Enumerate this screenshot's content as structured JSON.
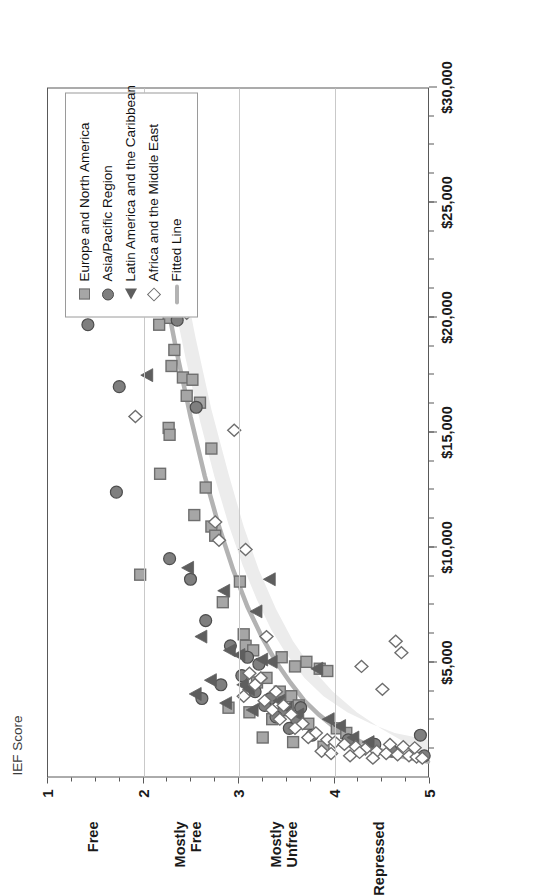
{
  "chart_data": {
    "type": "scatter",
    "title": "",
    "xlabel": "IEF Score",
    "ylabel": "",
    "xlim": [
      1,
      5
    ],
    "ylim": [
      0,
      30000
    ],
    "grid": true,
    "orientation": "rotated-90",
    "legend_position": "inside-upper-right",
    "axis": {
      "score_title": "IEF Score",
      "score_ticks": [
        "1",
        "2",
        "3",
        "4",
        "5"
      ],
      "score_tick_values": [
        1,
        2,
        3,
        4,
        5
      ],
      "money_ticks": [
        "$5,000",
        "$10,000",
        "$15,000",
        "$20,000",
        "$25,000",
        "$30,000"
      ],
      "money_tick_values": [
        5000,
        10000,
        15000,
        20000,
        25000,
        30000
      ],
      "money_minor_step": 1250,
      "categories": [
        {
          "label": "Free",
          "at": 1.5
        },
        {
          "label": "Mostly\nFree",
          "at": 2.5
        },
        {
          "label": "Mostly\nUnfree",
          "at": 3.5
        },
        {
          "label": "Repressed",
          "at": 4.5
        }
      ]
    },
    "colors": {
      "square": "#a6a6a6",
      "square_edge": "#6e6e6e",
      "circle": "#7f7f7f",
      "circle_edge": "#4d4d4d",
      "triangle": "#5e5e5e",
      "diamond": "#ffffff",
      "diamond_edge": "#6e6e6e",
      "fitted_line": "#b3b3b3",
      "band": "#ececec",
      "grid": "#c9c9c9",
      "frame": "#595959"
    },
    "legend": [
      {
        "label": "Europe and North America",
        "marker": "square-marker"
      },
      {
        "label": "Asia/Pacific Region",
        "marker": "circle-marker"
      },
      {
        "label": "Latin America and the Caribbean",
        "marker": "triangle-marker"
      },
      {
        "label": "Africa and the Middle East",
        "marker": "diamond-marker"
      },
      {
        "label": "Fitted Line",
        "marker": "line-swatch"
      }
    ],
    "series": [
      {
        "name": "Europe and North America",
        "marker": "square",
        "points": [
          [
            2.1,
            24700
          ],
          [
            1.95,
            23400
          ],
          [
            1.98,
            21000
          ],
          [
            2.27,
            20000
          ],
          [
            2.17,
            19700
          ],
          [
            2.33,
            18600
          ],
          [
            2.3,
            17900
          ],
          [
            2.42,
            17400
          ],
          [
            2.52,
            17300
          ],
          [
            2.46,
            16600
          ],
          [
            2.6,
            16300
          ],
          [
            2.27,
            15200
          ],
          [
            2.28,
            14900
          ],
          [
            2.72,
            14300
          ],
          [
            2.18,
            13200
          ],
          [
            2.66,
            12600
          ],
          [
            2.54,
            11400
          ],
          [
            2.72,
            10900
          ],
          [
            2.76,
            10500
          ],
          [
            1.97,
            8800
          ],
          [
            3.02,
            8500
          ],
          [
            2.84,
            7600
          ],
          [
            3.06,
            6200
          ],
          [
            3.08,
            5700
          ],
          [
            3.16,
            5500
          ],
          [
            3.46,
            5200
          ],
          [
            3.72,
            5000
          ],
          [
            3.6,
            4800
          ],
          [
            3.86,
            4700
          ],
          [
            3.94,
            4600
          ],
          [
            3.3,
            4300
          ],
          [
            3.2,
            4100
          ],
          [
            3.44,
            3700
          ],
          [
            3.56,
            3500
          ],
          [
            3.64,
            3100
          ],
          [
            2.9,
            3000
          ],
          [
            3.12,
            2800
          ],
          [
            3.36,
            2500
          ],
          [
            3.74,
            2300
          ],
          [
            4.04,
            2100
          ],
          [
            4.14,
            1900
          ],
          [
            3.26,
            1700
          ],
          [
            3.58,
            1500
          ],
          [
            3.9,
            1300
          ]
        ]
      },
      {
        "name": "Asia/Pacific Region",
        "marker": "circle",
        "points": [
          [
            1.35,
            21500
          ],
          [
            1.42,
            19700
          ],
          [
            1.75,
            17000
          ],
          [
            1.72,
            12400
          ],
          [
            2.36,
            19900
          ],
          [
            2.56,
            16100
          ],
          [
            2.28,
            9500
          ],
          [
            2.5,
            8600
          ],
          [
            2.66,
            6800
          ],
          [
            2.92,
            5700
          ],
          [
            3.1,
            5200
          ],
          [
            3.22,
            4900
          ],
          [
            3.04,
            4400
          ],
          [
            2.82,
            4000
          ],
          [
            3.18,
            3700
          ],
          [
            3.34,
            3400
          ],
          [
            3.28,
            3100
          ],
          [
            3.48,
            2900
          ],
          [
            3.4,
            2600
          ],
          [
            3.62,
            2400
          ],
          [
            3.54,
            2100
          ],
          [
            3.78,
            1800
          ],
          [
            4.16,
            1600
          ],
          [
            4.44,
            1400
          ],
          [
            4.92,
            1800
          ],
          [
            4.96,
            900
          ],
          [
            2.62,
            3400
          ],
          [
            3.66,
            3000
          ],
          [
            4.62,
            1100
          ]
        ]
      },
      {
        "name": "Latin America and the Caribbean",
        "marker": "triangle",
        "points": [
          [
            2.05,
            17500
          ],
          [
            2.48,
            9100
          ],
          [
            2.86,
            8100
          ],
          [
            3.34,
            8600
          ],
          [
            3.2,
            7200
          ],
          [
            2.62,
            6100
          ],
          [
            2.92,
            5500
          ],
          [
            3.02,
            5300
          ],
          [
            3.26,
            5100
          ],
          [
            3.36,
            5000
          ],
          [
            3.84,
            4700
          ],
          [
            2.72,
            4200
          ],
          [
            2.56,
            3600
          ],
          [
            3.06,
            4000
          ],
          [
            3.12,
            3800
          ],
          [
            3.44,
            3300
          ],
          [
            3.52,
            3000
          ],
          [
            3.64,
            2700
          ],
          [
            3.96,
            2500
          ],
          [
            4.08,
            2200
          ],
          [
            4.22,
            1700
          ],
          [
            4.38,
            1500
          ],
          [
            3.16,
            2900
          ],
          [
            2.88,
            3200
          ]
        ]
      },
      {
        "name": "Africa and the Middle East",
        "marker": "diamond",
        "points": [
          [
            2.46,
            20200
          ],
          [
            1.92,
            15700
          ],
          [
            2.96,
            15100
          ],
          [
            2.76,
            11100
          ],
          [
            2.8,
            10300
          ],
          [
            3.08,
            9900
          ],
          [
            3.3,
            6100
          ],
          [
            4.66,
            5900
          ],
          [
            4.72,
            5400
          ],
          [
            4.3,
            4800
          ],
          [
            4.52,
            3800
          ],
          [
            3.12,
            4500
          ],
          [
            3.24,
            4300
          ],
          [
            3.18,
            4000
          ],
          [
            3.4,
            3700
          ],
          [
            3.06,
            3500
          ],
          [
            3.28,
            3300
          ],
          [
            3.48,
            3100
          ],
          [
            3.36,
            2900
          ],
          [
            3.56,
            2700
          ],
          [
            3.44,
            2500
          ],
          [
            3.68,
            2300
          ],
          [
            3.6,
            2100
          ],
          [
            3.82,
            1900
          ],
          [
            3.74,
            1700
          ],
          [
            3.94,
            1600
          ],
          [
            4.02,
            1500
          ],
          [
            4.12,
            1400
          ],
          [
            4.24,
            1300
          ],
          [
            4.34,
            1200
          ],
          [
            4.46,
            1100
          ],
          [
            4.56,
            1000
          ],
          [
            4.68,
            950
          ],
          [
            4.8,
            900
          ],
          [
            4.88,
            850
          ],
          [
            4.94,
            800
          ],
          [
            3.88,
            1100
          ],
          [
            4.18,
            900
          ],
          [
            4.42,
            800
          ],
          [
            4.6,
            1400
          ],
          [
            4.74,
            1300
          ],
          [
            4.86,
            1250
          ],
          [
            3.98,
            1000
          ],
          [
            4.28,
            1050
          ]
        ]
      }
    ],
    "fitted_line": {
      "name": "Fitted Line",
      "points": [
        [
          2.08,
          24600
        ],
        [
          2.2,
          21800
        ],
        [
          2.35,
          18600
        ],
        [
          2.5,
          15700
        ],
        [
          2.65,
          13100
        ],
        [
          2.8,
          10900
        ],
        [
          2.95,
          9000
        ],
        [
          3.1,
          7400
        ],
        [
          3.25,
          6100
        ],
        [
          3.4,
          5000
        ],
        [
          3.55,
          4100
        ],
        [
          3.7,
          3300
        ],
        [
          3.85,
          2700
        ],
        [
          4.0,
          2200
        ],
        [
          4.2,
          1700
        ],
        [
          4.4,
          1300
        ],
        [
          4.6,
          1000
        ],
        [
          4.8,
          800
        ],
        [
          5.0,
          650
        ]
      ]
    },
    "confidence_band": {
      "upper": [
        [
          2.0,
          26600
        ],
        [
          2.15,
          24200
        ],
        [
          2.3,
          21200
        ],
        [
          2.45,
          18200
        ],
        [
          2.6,
          15500
        ],
        [
          2.75,
          13100
        ],
        [
          2.9,
          11000
        ],
        [
          3.05,
          9200
        ],
        [
          3.2,
          7700
        ],
        [
          3.35,
          6400
        ],
        [
          3.5,
          5400
        ],
        [
          3.7,
          4300
        ],
        [
          3.9,
          3500
        ],
        [
          4.15,
          2800
        ],
        [
          4.4,
          2300
        ],
        [
          4.65,
          1900
        ],
        [
          5.0,
          1600
        ]
      ],
      "lower": [
        [
          2.2,
          26600
        ],
        [
          2.38,
          22800
        ],
        [
          2.55,
          19200
        ],
        [
          2.72,
          16000
        ],
        [
          2.9,
          13200
        ],
        [
          3.06,
          10900
        ],
        [
          3.22,
          9000
        ],
        [
          3.4,
          7300
        ],
        [
          3.58,
          5900
        ],
        [
          3.78,
          4700
        ],
        [
          4.0,
          3700
        ],
        [
          4.25,
          2800
        ],
        [
          4.5,
          2100
        ],
        [
          4.75,
          1500
        ],
        [
          5.0,
          1100
        ]
      ]
    }
  }
}
